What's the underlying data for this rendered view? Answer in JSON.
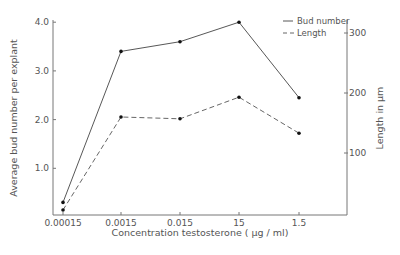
{
  "chart_data": {
    "type": "line",
    "title": "",
    "xlabel": "Concentration testosterone (µg/ml)",
    "ylabel": "Average bud number per explant",
    "ylabel_right": "Length in µm",
    "categories": [
      "0.00015",
      "0.0015",
      "0.015",
      "15",
      "1.5"
    ],
    "y_ticks": [
      "1.0",
      "2.0",
      "3.0",
      "4.0"
    ],
    "y_right_ticks": [
      "100",
      "200",
      "300"
    ],
    "ylim": [
      0,
      4.0
    ],
    "ylim_right": [
      0,
      310
    ],
    "grid": false,
    "legend_position": "top-right (inside)",
    "series": [
      {
        "name": "Bud number",
        "axis": "left",
        "style": "solid",
        "values": [
          0.3,
          3.4,
          3.6,
          4.0,
          2.45
        ]
      },
      {
        "name": "Length",
        "axis": "right",
        "style": "dashed",
        "values": [
          5,
          160,
          157,
          193,
          133
        ]
      }
    ]
  },
  "legend": {
    "items": [
      {
        "label": "Bud number",
        "style": "solid"
      },
      {
        "label": "Length",
        "style": "dashed"
      }
    ]
  },
  "axes": {
    "x_title": "Concentration testosterone ( µg / ml)",
    "y_left_title": "Average bud number per explant",
    "y_right_title": "Length in µm"
  }
}
